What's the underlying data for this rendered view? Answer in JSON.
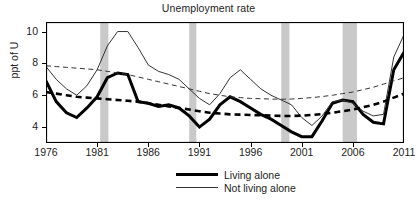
{
  "chart_data": {
    "type": "line",
    "title": "Unemployment rate",
    "xlabel": "",
    "ylabel": "ppt of U",
    "xlim": [
      1976,
      2011
    ],
    "ylim": [
      3.0,
      10.6
    ],
    "xticks": [
      1976,
      1981,
      1986,
      1991,
      1996,
      2001,
      2006,
      2011
    ],
    "yticks": [
      4,
      6,
      8,
      10
    ],
    "grid": false,
    "legend_position": "bottom-center",
    "x": [
      1976,
      1977,
      1978,
      1979,
      1980,
      1981,
      1982,
      1983,
      1984,
      1985,
      1986,
      1987,
      1988,
      1989,
      1990,
      1991,
      1992,
      1993,
      1994,
      1995,
      1996,
      1997,
      1998,
      1999,
      2000,
      2001,
      2002,
      2003,
      2004,
      2005,
      2006,
      2007,
      2008,
      2009,
      2010,
      2011
    ],
    "series": [
      {
        "name": "Living alone",
        "style": "solid-thick",
        "color": "#000000",
        "values": [
          6.9,
          5.6,
          4.9,
          4.6,
          5.2,
          5.9,
          7.1,
          7.4,
          7.3,
          5.6,
          5.5,
          5.3,
          5.4,
          5.2,
          4.7,
          4.0,
          4.5,
          5.4,
          5.9,
          5.6,
          5.2,
          4.8,
          4.5,
          4.1,
          3.7,
          3.4,
          3.4,
          4.4,
          5.5,
          5.7,
          5.6,
          4.8,
          4.3,
          4.2,
          7.6,
          8.7
        ]
      },
      {
        "name": "Not living alone",
        "style": "solid-thin",
        "color": "#333333",
        "values": [
          7.8,
          7.0,
          6.4,
          6.0,
          6.6,
          7.6,
          9.1,
          10.0,
          10.0,
          9.0,
          7.9,
          7.5,
          7.3,
          7.0,
          6.4,
          5.8,
          5.4,
          6.1,
          7.1,
          7.6,
          7.0,
          6.4,
          6.0,
          5.7,
          5.4,
          4.6,
          4.1,
          4.7,
          5.6,
          5.7,
          5.5,
          5.0,
          4.7,
          4.8,
          8.4,
          9.8
        ]
      },
      {
        "name": "Living alone trend",
        "style": "dashed-thick",
        "color": "#000000",
        "values": [
          6.2,
          6.1,
          6.0,
          5.9,
          5.85,
          5.8,
          5.75,
          5.7,
          5.65,
          5.6,
          5.5,
          5.4,
          5.3,
          5.2,
          5.1,
          5.0,
          4.9,
          4.85,
          4.8,
          4.78,
          4.76,
          4.74,
          4.72,
          4.7,
          4.7,
          4.72,
          4.76,
          4.82,
          4.9,
          5.0,
          5.1,
          5.25,
          5.4,
          5.6,
          5.85,
          6.1
        ]
      },
      {
        "name": "Not living alone trend",
        "style": "dashed-thin",
        "color": "#333333",
        "values": [
          7.85,
          7.8,
          7.75,
          7.7,
          7.65,
          7.6,
          7.5,
          7.4,
          7.3,
          7.15,
          7.0,
          6.85,
          6.7,
          6.55,
          6.4,
          6.25,
          6.1,
          6.0,
          5.9,
          5.85,
          5.8,
          5.78,
          5.76,
          5.75,
          5.76,
          5.8,
          5.85,
          5.92,
          6.0,
          6.1,
          6.2,
          6.35,
          6.5,
          6.7,
          6.9,
          7.1
        ]
      }
    ],
    "shaded_bands": [
      {
        "label": "recession-1",
        "start": 1981.3,
        "end": 1982.1
      },
      {
        "label": "recession-2",
        "start": 1990.0,
        "end": 1990.7
      },
      {
        "label": "recession-3",
        "start": 1999.0,
        "end": 1999.8
      },
      {
        "label": "recession-4",
        "start": 2005.0,
        "end": 2006.4
      }
    ],
    "band_color": "#c9c9c9",
    "frame_color": "#000000",
    "background": "#ffffff"
  },
  "legend": {
    "items": [
      {
        "label": "Living alone"
      },
      {
        "label": "Not living alone"
      }
    ]
  }
}
